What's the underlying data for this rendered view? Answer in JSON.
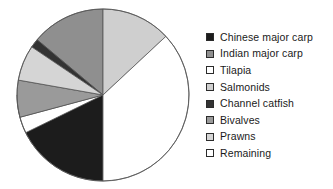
{
  "chart_data": {
    "type": "pie",
    "title": "",
    "subtitle": "",
    "xlabel": "",
    "ylabel": "",
    "grid": false,
    "legend_position": "right",
    "start_angle_deg": 0,
    "direction": "clockwise",
    "categories": [
      "Chinese major carp",
      "Indian major carp",
      "Tilapia",
      "Salmonids",
      "Channel catfish",
      "Bivalves",
      "Prawns",
      "Remaining"
    ],
    "values": [
      25,
      14,
      3,
      13,
      1.5,
      7,
      11,
      25.5
    ],
    "colors": [
      "#1c1c1c",
      "#8f8f8f",
      "#ffffff",
      "#cfcfcf",
      "#333333",
      "#9a9a9a",
      "#d5d5d5",
      "#ffffff"
    ],
    "slices": [
      {
        "label": "Chinese major carp",
        "value": 25,
        "color": "#1c1c1c",
        "start_deg": 180,
        "end_deg": 270
      },
      {
        "label": "Indian major carp",
        "value": 14,
        "color": "#8f8f8f",
        "start_deg": 310,
        "end_deg": 360
      },
      {
        "label": "Tilapia",
        "value": 3,
        "color": "#ffffff",
        "start_deg": 244,
        "end_deg": 255
      },
      {
        "label": "Salmonids",
        "value": 13,
        "color": "#cfcfcf",
        "start_deg": 0,
        "end_deg": 47
      },
      {
        "label": "Channel catfish",
        "value": 1.5,
        "color": "#333333",
        "start_deg": 304,
        "end_deg": 310
      },
      {
        "label": "Bivalves",
        "value": 7,
        "color": "#9a9a9a",
        "start_deg": 255,
        "end_deg": 280
      },
      {
        "label": "Prawns",
        "value": 11,
        "color": "#d5d5d5",
        "start_deg": 280,
        "end_deg": 304
      },
      {
        "label": "Remaining",
        "value": 25.5,
        "color": "#ffffff",
        "start_deg": 47,
        "end_deg": 180
      }
    ],
    "geometry": {
      "center_x": 89,
      "center_y": 91,
      "radius": 86,
      "stroke": "#555555",
      "stroke_width": 0.8
    }
  },
  "legend": {
    "items": [
      {
        "label": "Chinese major carp",
        "swatch": "#1c1c1c"
      },
      {
        "label": "Indian major carp",
        "swatch": "#8f8f8f"
      },
      {
        "label": "Tilapia",
        "swatch": "#ffffff"
      },
      {
        "label": "Salmonids",
        "swatch": "#cfcfcf"
      },
      {
        "label": "Channel catfish",
        "swatch": "#333333"
      },
      {
        "label": "Bivalves",
        "swatch": "#9a9a9a"
      },
      {
        "label": "Prawns",
        "swatch": "#d5d5d5"
      },
      {
        "label": "Remaining",
        "swatch": "#ffffff"
      }
    ]
  }
}
